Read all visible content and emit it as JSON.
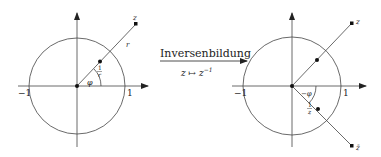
{
  "transform": {
    "title": "Inversenbildung",
    "mapping": "z ↦ z",
    "mapping_exponent": "−1"
  },
  "left_diagram": {
    "axis_neg_label": "−1",
    "axis_pos_label": "1",
    "point_z_label": "z",
    "radius_label": "r",
    "angle_label": "φ",
    "inner_point_num": "1",
    "inner_point_den": "r"
  },
  "right_diagram": {
    "axis_neg_label": "−1",
    "axis_pos_label": "1",
    "point_z_label": "z",
    "point_zbar_label": "z̄",
    "angle_label": "−φ",
    "inner_point_num": "1",
    "inner_point_den": "z"
  }
}
